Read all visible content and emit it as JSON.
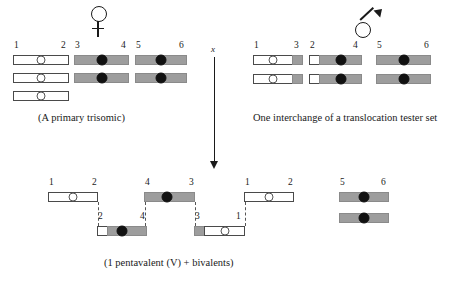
{
  "figure": {
    "title_parent_female_caption": "(A primary trisomic)",
    "title_parent_male_caption": "One interchange of a translocation tester set",
    "progeny_caption": "(1 pentavalent (V) + bivalents)",
    "cross_symbol": "x",
    "female_symbol_name": "female-venus-symbol",
    "male_symbol_name": "male-mars-symbol"
  },
  "colors": {
    "white_arm": "#ffffff",
    "gray_arm": "#9d9d9d",
    "outline": "#4a4a4a",
    "centromere_open": "#ffffff",
    "centromere_filled": "#111111",
    "text": "#1a1a1a",
    "dashed_connector": "#555555"
  },
  "female_parent": {
    "label": "A primary trisomic",
    "groups": [
      {
        "group_name": "trisomic-group-1-2",
        "arm_labels": [
          "1",
          "2"
        ],
        "chromosomes": [
          {
            "name": "chromosome-1-2-a",
            "segments": [
              {
                "color": "white"
              }
            ],
            "centromere": "open"
          },
          {
            "name": "chromosome-1-2-b",
            "segments": [
              {
                "color": "white"
              }
            ],
            "centromere": "open"
          },
          {
            "name": "chromosome-1-2-c",
            "segments": [
              {
                "color": "white"
              }
            ],
            "centromere": "open"
          }
        ]
      },
      {
        "group_name": "bivalent-group-3-4",
        "arm_labels": [
          "3",
          "4"
        ],
        "chromosomes": [
          {
            "name": "chromosome-3-4-a",
            "segments": [
              {
                "color": "gray"
              }
            ],
            "centromere": "filled"
          },
          {
            "name": "chromosome-3-4-b",
            "segments": [
              {
                "color": "gray"
              }
            ],
            "centromere": "filled"
          }
        ]
      },
      {
        "group_name": "bivalent-group-5-6",
        "arm_labels": [
          "5",
          "6"
        ],
        "chromosomes": [
          {
            "name": "chromosome-5-6-a",
            "segments": [
              {
                "color": "gray"
              }
            ],
            "centromere": "filled"
          },
          {
            "name": "chromosome-5-6-b",
            "segments": [
              {
                "color": "gray"
              }
            ],
            "centromere": "filled"
          }
        ]
      }
    ]
  },
  "male_parent": {
    "label": "One interchange of a translocation tester set",
    "groups": [
      {
        "group_name": "translocation-group-1-3",
        "arm_labels": [
          "1",
          "3"
        ],
        "chromosomes": [
          {
            "name": "chromosome-1-3-a",
            "centromere": "open"
          },
          {
            "name": "chromosome-1-3-b",
            "centromere": "open"
          }
        ]
      },
      {
        "group_name": "translocation-group-2-4",
        "arm_labels": [
          "2",
          "4"
        ],
        "chromosomes": [
          {
            "name": "chromosome-2-4-a",
            "centromere": "filled"
          },
          {
            "name": "chromosome-2-4-b",
            "centromere": "filled"
          }
        ]
      },
      {
        "group_name": "bivalent-group-5-6",
        "arm_labels": [
          "5",
          "6"
        ],
        "chromosomes": [
          {
            "name": "chromosome-5-6-a",
            "centromere": "filled"
          },
          {
            "name": "chromosome-5-6-b",
            "centromere": "filled"
          }
        ]
      }
    ]
  },
  "progeny": {
    "label": "1 pentavalent (V) + bivalents",
    "pentavalent": {
      "name": "pentavalent-configuration",
      "upper_row": [
        {
          "name": "pentavalent-chromosome-1-2",
          "arm_labels": [
            "1",
            "2"
          ],
          "centromere": "open"
        },
        {
          "name": "pentavalent-chromosome-4-3",
          "arm_labels": [
            "4",
            "3"
          ],
          "centromere": "filled"
        },
        {
          "name": "pentavalent-chromosome-1-2-right",
          "arm_labels": [
            "1",
            "2"
          ],
          "centromere": "open"
        }
      ],
      "lower_row": [
        {
          "name": "pentavalent-chromosome-2-4",
          "arm_labels": [
            "2",
            "4"
          ],
          "centromere": "filled"
        },
        {
          "name": "pentavalent-chromosome-3-1",
          "arm_labels": [
            "3",
            "1"
          ],
          "centromere": "open"
        }
      ]
    },
    "bivalent": {
      "name": "progeny-bivalent-5-6",
      "arm_labels": [
        "5",
        "6"
      ],
      "chromosomes": [
        {
          "name": "progeny-chromosome-5-6-a",
          "centromere": "filled"
        },
        {
          "name": "progeny-chromosome-5-6-b",
          "centromere": "filled"
        }
      ]
    }
  }
}
